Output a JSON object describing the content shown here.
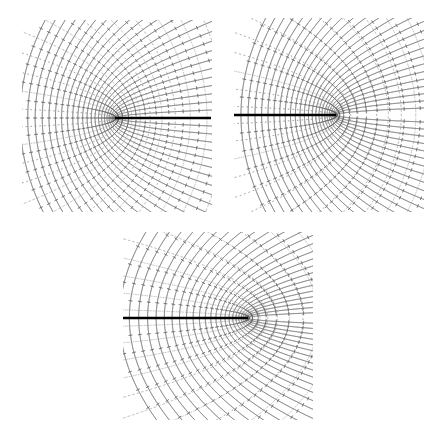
{
  "figure": {
    "title": "",
    "background_color": "#ffffff",
    "width": 438,
    "height": 438
  },
  "chart_data": {
    "type": "line",
    "title": "",
    "subtitle": "",
    "xlabel": "",
    "ylabel": "",
    "grid": false,
    "legend": null,
    "panels": [
      {
        "name": "panel-top-left",
        "index": 1,
        "bounds": {
          "x": 22,
          "y": 20,
          "width": 190,
          "height": 192
        },
        "slit": {
          "label": "branch-cut",
          "x_start": 115,
          "x_end": 211,
          "y": 118,
          "color": "#000000",
          "thickness": 2.4
        },
        "stagnation_point": {
          "x": 115,
          "y": 118
        },
        "flow_direction": "left-to-right",
        "family_a": {
          "name": "streamlines",
          "style": "solid",
          "color": "#6f6f6f",
          "count": 24,
          "curvature": 1.0
        },
        "family_b": {
          "name": "equipotentials",
          "style": "tick-dashes",
          "color": "#8a8a8a",
          "count": 26
        },
        "axis_range": {
          "xlim": [
            -3.0,
            3.0
          ],
          "ylim": [
            -3.0,
            3.0
          ]
        }
      },
      {
        "name": "panel-top-right",
        "index": 2,
        "bounds": {
          "x": 234,
          "y": 18,
          "width": 190,
          "height": 194
        },
        "slit": {
          "label": "branch-cut",
          "x_start": 234,
          "x_end": 336,
          "y": 115,
          "color": "#000000",
          "thickness": 2.4
        },
        "stagnation_point": {
          "x": 336,
          "y": 115
        },
        "flow_direction": "radial-from-tip",
        "family_a": {
          "name": "streamlines",
          "style": "solid",
          "color": "#6f6f6f",
          "count": 26,
          "curvature": 1.0
        },
        "family_b": {
          "name": "equipotentials",
          "style": "tick-dashes",
          "color": "#8a8a8a",
          "count": 28
        },
        "axis_range": {
          "xlim": [
            -3.0,
            3.0
          ],
          "ylim": [
            -3.0,
            3.0
          ]
        }
      },
      {
        "name": "panel-bottom-center",
        "index": 3,
        "bounds": {
          "x": 123,
          "y": 232,
          "width": 190,
          "height": 188
        },
        "slit": {
          "label": "branch-cut",
          "x_start": 123,
          "x_end": 248,
          "y": 318,
          "color": "#000000",
          "thickness": 2.4
        },
        "stagnation_point": {
          "x": 248,
          "y": 318
        },
        "flow_direction": "radial-from-tip",
        "family_a": {
          "name": "streamlines",
          "style": "solid",
          "color": "#6f6f6f",
          "count": 26,
          "curvature": 1.35
        },
        "family_b": {
          "name": "equipotentials",
          "style": "tick-dashes",
          "color": "#8a8a8a",
          "count": 28
        },
        "axis_range": {
          "xlim": [
            -3.0,
            3.0
          ],
          "ylim": [
            -3.0,
            3.0
          ]
        }
      }
    ],
    "colors": {
      "stream_line": "#6f6f6f",
      "equipotential": "#8a8a8a",
      "slit": "#000000",
      "background": "#ffffff"
    }
  }
}
